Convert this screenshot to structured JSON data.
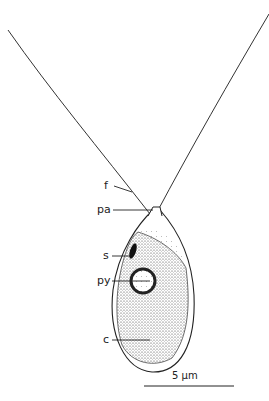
{
  "figure": {
    "labels": [
      {
        "id": "f",
        "text": "f",
        "x": 104,
        "y": 182
      },
      {
        "id": "pa",
        "text": "pa",
        "x": 98,
        "y": 206
      },
      {
        "id": "s",
        "text": "s",
        "x": 104,
        "y": 252
      },
      {
        "id": "py",
        "text": "py",
        "x": 98,
        "y": 277
      },
      {
        "id": "c",
        "text": "c",
        "x": 104,
        "y": 336
      }
    ],
    "scale_bar": {
      "text": "5 µm",
      "x1": 144,
      "x2": 234,
      "y": 386
    },
    "colors": {
      "ink": "#222222",
      "background": "#ffffff"
    }
  }
}
